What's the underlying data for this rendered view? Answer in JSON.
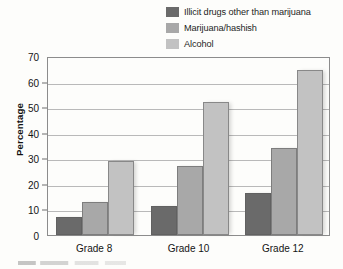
{
  "chart_data": {
    "type": "bar",
    "title": "",
    "subtitle": "",
    "xlabel": "",
    "ylabel": "Percentage",
    "categories": [
      "Grade 8",
      "Grade 10",
      "Grade 12"
    ],
    "series": [
      {
        "name": "Illicit drugs other than marijuana",
        "values": [
          7,
          11.5,
          16.5
        ],
        "color": "#6a6a6a"
      },
      {
        "name": "Marijuana/hashish",
        "values": [
          13,
          27,
          34
        ],
        "color": "#a8a8a8"
      },
      {
        "name": "Alcohol",
        "values": [
          29,
          52,
          64.5
        ],
        "color": "#c2c2c2"
      }
    ],
    "ylim": [
      0,
      70
    ],
    "ytick_values": [
      0,
      10,
      20,
      30,
      40,
      50,
      60,
      70
    ],
    "ytick_labels": [
      "0",
      "10",
      "20",
      "30",
      "40",
      "50",
      "60",
      "70"
    ],
    "grid": true,
    "grid_axis": "y",
    "legend_position": "top-right",
    "bar_mode": "grouped"
  },
  "legend": {
    "items": [
      {
        "label": "Illicit drugs other than marijuana",
        "swatch_name": "legend-swatch-illicit-drugs"
      },
      {
        "label": "Marijuana/hashish",
        "swatch_name": "legend-swatch-marijuana"
      },
      {
        "label": "Alcohol",
        "swatch_name": "legend-swatch-alcohol"
      }
    ]
  },
  "colors": {
    "background": "#fdfdfb",
    "frame": "#8c8c8c",
    "gridline": "#b9b9b9",
    "text": "#141414",
    "series_dark": "#6a6a6a",
    "series_medium": "#a8a8a8",
    "series_light": "#c2c2c2"
  }
}
